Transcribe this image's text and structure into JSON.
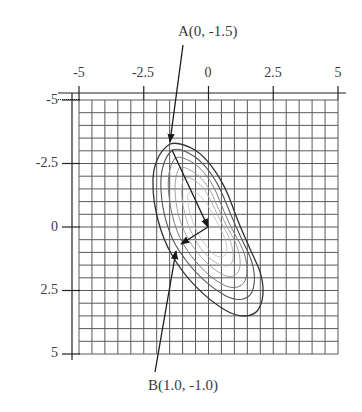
{
  "figure": {
    "type": "contour-plot-with-path",
    "x_axis": {
      "position": "top",
      "ticks": [
        {
          "value": -5,
          "label": "-5"
        },
        {
          "value": -2.5,
          "label": "-2.5"
        },
        {
          "value": 0,
          "label": "0"
        },
        {
          "value": 2.5,
          "label": "2.5"
        },
        {
          "value": 5,
          "label": "5"
        }
      ]
    },
    "y_axis": {
      "position": "left",
      "ticks": [
        {
          "value": -5,
          "label": "-5"
        },
        {
          "value": -2.5,
          "label": "-2.5"
        },
        {
          "value": 0,
          "label": "0"
        },
        {
          "value": 2.5,
          "label": "2.5"
        },
        {
          "value": 5,
          "label": "5"
        }
      ]
    },
    "grid": {
      "on": true,
      "step": 0.5
    },
    "points": {
      "A": {
        "label": "A(0, -1.5)",
        "name": "A",
        "coords": [
          0,
          -1.5
        ]
      },
      "B": {
        "label": "B(1.0, -1.0)",
        "name": "B",
        "coords": [
          1.0,
          -1.0
        ]
      }
    },
    "contours": {
      "count": 6,
      "shape": "elongated ellipses tilted diagonally from upper-left to lower-right"
    },
    "colors": {
      "grid": "#555555",
      "axis": "#222222",
      "contour_outer": "#333333",
      "contour_inner": "#9a9a9a",
      "path": "#1a1a1a",
      "text": "#3a3a3a"
    }
  }
}
